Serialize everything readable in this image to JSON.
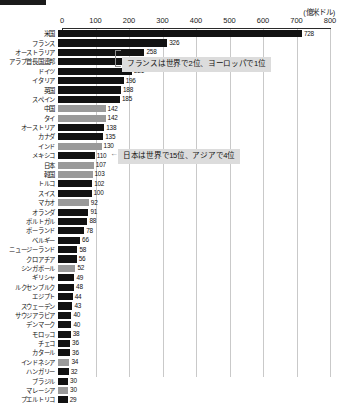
{
  "unit_label": "(億米ドル)",
  "axis": {
    "ticks": [
      "0",
      "100",
      "200",
      "300",
      "400",
      "500",
      "600",
      "700",
      "800"
    ]
  },
  "annotations": {
    "france": "フランスは世界で2位、ヨーロッパで1位",
    "japan": "日本は世界で15位、アジアで4位"
  },
  "chart_data": {
    "type": "bar",
    "orientation": "horizontal",
    "title": "",
    "xlabel": "(億米ドル)",
    "ylabel": "",
    "xlim": [
      0,
      800
    ],
    "grid": true,
    "legend": null,
    "series_colors": {
      "default": "#121212",
      "asia": "#9a9a9a"
    },
    "categories": [
      "米国",
      "フランス",
      "オーストラリア",
      "アラブ首長国連邦",
      "ドイツ",
      "イタリア",
      "英国",
      "スペイン",
      "中国",
      "タイ",
      "オーストリア",
      "カナダ",
      "インド",
      "メキシコ",
      "日本",
      "韓国",
      "トルコ",
      "スイス",
      "マカオ",
      "オランダ",
      "ポルトガル",
      "ポーランド",
      "ベルギー",
      "ニュージーランド",
      "クロアチア",
      "シンガポール",
      "ギリシャ",
      "ルクセンブルク",
      "エジプト",
      "スウェーデン",
      "サウジアラビア",
      "デンマーク",
      "モロッコ",
      "チェコ",
      "カタール",
      "インドネシア",
      "ハンガリー",
      "ブラジル",
      "マレーシア",
      "プエルトリコ"
    ],
    "values": [
      728,
      326,
      258,
      246,
      221,
      196,
      188,
      185,
      142,
      142,
      138,
      135,
      130,
      110,
      107,
      103,
      102,
      100,
      92,
      91,
      88,
      78,
      66,
      58,
      56,
      52,
      49,
      48,
      44,
      43,
      40,
      40,
      38,
      36,
      36,
      34,
      32,
      30,
      30,
      29
    ],
    "highlight_asia": [
      false,
      false,
      false,
      false,
      false,
      false,
      false,
      false,
      true,
      true,
      false,
      false,
      true,
      false,
      true,
      true,
      false,
      false,
      true,
      false,
      false,
      false,
      false,
      false,
      false,
      true,
      false,
      false,
      false,
      false,
      false,
      false,
      false,
      false,
      false,
      true,
      false,
      false,
      true,
      false
    ]
  }
}
